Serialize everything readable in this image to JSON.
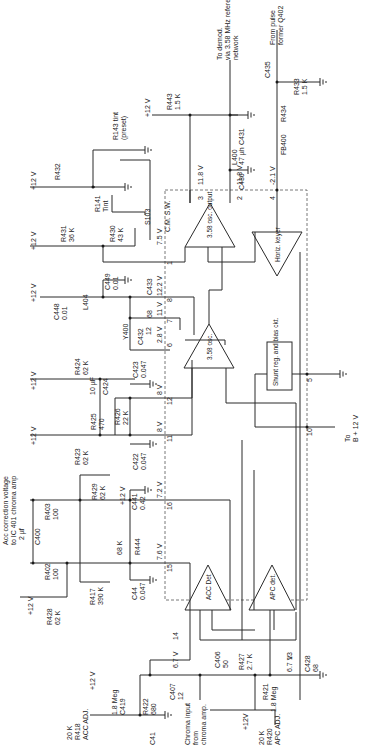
{
  "diagram": {
    "type": "circuit-schematic",
    "orientation": "rotated-90-ccw",
    "ic_block": "C.M. S.W."
  },
  "blocks": {
    "osc_output": "3.58 osc. output",
    "osc": "3.58 osc.",
    "horiz_keyer": "Horiz. keyer",
    "shunt_reg": "Shunt reg. and bias ckt.",
    "acc_det": "ACC Det",
    "apc_det": "APC det."
  },
  "pins": [
    {
      "pin": "1",
      "voltage": "7.5 V"
    },
    {
      "pin": "2",
      "voltage": "11.8 V"
    },
    {
      "pin": "3",
      "voltage": "11.8 V"
    },
    {
      "pin": "4",
      "voltage": "-2.1 V"
    },
    {
      "pin": "5",
      "voltage": ""
    },
    {
      "pin": "6",
      "voltage": "2.8 V"
    },
    {
      "pin": "7",
      "voltage": "11 V"
    },
    {
      "pin": "8",
      "voltage": "12.2 V"
    },
    {
      "pin": "10",
      "voltage": ""
    },
    {
      "pin": "11",
      "voltage": "8 V"
    },
    {
      "pin": "12",
      "voltage": "8 V"
    },
    {
      "pin": "13",
      "voltage": "6.7 V"
    },
    {
      "pin": "14",
      "voltage": "6.7 V"
    },
    {
      "pin": "15",
      "voltage": "7.6 V"
    },
    {
      "pin": "16",
      "voltage": "7.2 V"
    }
  ],
  "components": {
    "R443": {
      "name": "R443",
      "value": "1.5 K"
    },
    "R433": {
      "name": "R433",
      "value": "1.5 K"
    },
    "R434": {
      "name": "R434",
      "value": ""
    },
    "R432": {
      "name": "R432",
      "value": ""
    },
    "R143": {
      "name": "R143 tint",
      "value": "(preset)"
    },
    "R141": {
      "name": "R141",
      "value": "Tint"
    },
    "R431": {
      "name": "R431",
      "value": "36 K"
    },
    "R430": {
      "name": "R430",
      "value": "43 K"
    },
    "S103": {
      "name": "S103",
      "value": ""
    },
    "C449": {
      "name": "C449",
      "value": "0.01"
    },
    "C448": {
      "name": "C448",
      "value": "0.01"
    },
    "L404": {
      "name": "L404",
      "value": ""
    },
    "C433": {
      "name": "C433",
      "value": "68"
    },
    "Y400": {
      "name": "Y400",
      "value": ""
    },
    "C432": {
      "name": "C432",
      "value": "12"
    },
    "L400": {
      "name": "L400",
      "value": "47 µh"
    },
    "C430": {
      "name": "C430",
      "value": ""
    },
    "C431": {
      "name": "C431",
      "value": ""
    },
    "C435": {
      "name": "C435",
      "value": ""
    },
    "FB400": {
      "name": "FB400",
      "value": ""
    },
    "R424": {
      "name": "R424",
      "value": "62 K"
    },
    "C424": {
      "name": "C424",
      "value": "10 µF"
    },
    "R425": {
      "name": "R425",
      "value": "470"
    },
    "R426": {
      "name": "R426",
      "value": "22 K"
    },
    "C423": {
      "name": "C423",
      "value": "0.047"
    },
    "R423": {
      "name": "R423",
      "value": "62 K"
    },
    "C422": {
      "name": "C422",
      "value": "0.047"
    },
    "R403": {
      "name": "R403",
      "value": "100"
    },
    "C400": {
      "name": "C400",
      "value": "2 µf"
    },
    "R402": {
      "name": "R402",
      "value": "100"
    },
    "R429": {
      "name": "R429",
      "value": "62 K"
    },
    "C441": {
      "name": "C441",
      "value": "0.42"
    },
    "R444": {
      "name": "R444",
      "value": "68 K"
    },
    "C44": {
      "name": "C44",
      "value": "0.047"
    },
    "R428": {
      "name": "R428",
      "value": "62 K"
    },
    "R417": {
      "name": "R417",
      "value": "390 K"
    },
    "R418": {
      "name": "R418",
      "value": "20 K"
    },
    "R418_label": "ACC ADJ.",
    "C419": {
      "name": "C419",
      "value": "1.8 Meg"
    },
    "R422": {
      "name": "R422",
      "value": "680"
    },
    "C41": {
      "name": "C41",
      "value": ""
    },
    "C407": {
      "name": "C407",
      "value": "12"
    },
    "C406": {
      "name": "C406",
      "value": "50"
    },
    "R427": {
      "name": "R427",
      "value": "2.7 K"
    },
    "R421": {
      "name": "R421",
      "value": "1.8 Meg"
    },
    "R420": {
      "name": "R420",
      "value": "20 K"
    },
    "R420_label": "APC ADJ.",
    "C428": {
      "name": "C428",
      "value": "68"
    }
  },
  "labels": {
    "plus12": "+12 V",
    "plus12b": "+12V",
    "to_demod_1": "To demod.",
    "to_demod_2": "via 3.58 MHz reference",
    "to_demod_3": "network",
    "from_pulse_1": "From pulse",
    "from_pulse_2": "former Q402",
    "to_b_1": "To",
    "to_b_2": "B + 12 V",
    "acc_corr_1": "Acc correction voltage",
    "acc_corr_2": "to IC 401 chroma amp",
    "chroma_1": "Chroma input",
    "chroma_2": "from",
    "chroma_3": "chroma amp."
  }
}
